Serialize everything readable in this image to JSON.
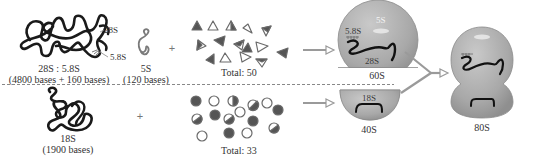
{
  "colors": {
    "rna_dark": "#1a1a1a",
    "rna_5s": "#7a7a7a",
    "protein_dark": "#555555",
    "protein_light_fill": "#ffffff",
    "protein_stroke": "#6a6a6a",
    "subunit_fill": "#a9a9a9",
    "subunit_highlight": "#c8c8c8",
    "arrow": "#9a9a9a",
    "divider": "#888888",
    "text": "#333333"
  },
  "large_subunit_row": {
    "rna_28s_label": "28S",
    "rna_58s_label": "5.8S",
    "rna_complex_label": "28S : 5.8S",
    "rna_complex_bases": "(4800 bases + 160 bases)",
    "rna_5s_label": "5S",
    "rna_5s_bases": "(120 bases)",
    "plus": "+",
    "protein_total": "Total:  50",
    "subunit": {
      "name": "60S",
      "inner_labels": {
        "rna_58s": "5.8S",
        "rna_5s": "5S",
        "rna_28s": "28S"
      }
    }
  },
  "small_subunit_row": {
    "rna_18s_label": "18S",
    "rna_18s_bases": "(1900 bases)",
    "plus": "+",
    "protein_total": "Total:  33",
    "subunit": {
      "name": "40S",
      "inner_labels": {
        "rna_18s": "18S"
      }
    }
  },
  "assembled": {
    "name": "80S"
  }
}
